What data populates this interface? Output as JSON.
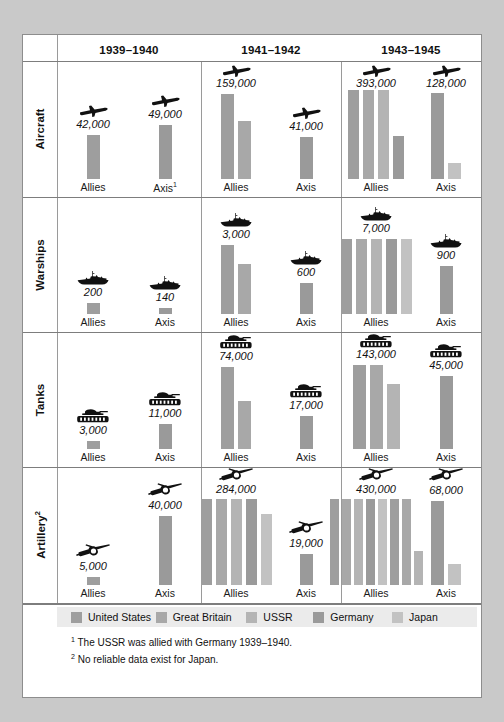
{
  "chart_data": {
    "type": "bar",
    "xlabel": "",
    "ylabel": "",
    "grid": false,
    "legend_position": "bottom",
    "columns": [
      "1939–1940",
      "1941–1942",
      "1943–1945"
    ],
    "rows": [
      "Aircraft",
      "Warships",
      "Tanks",
      "Artillery"
    ],
    "series": [
      {
        "name": "United States",
        "color": "#9e9e9e"
      },
      {
        "name": "Great Britain",
        "color": "#a8a8a8"
      },
      {
        "name": "USSR",
        "color": "#b4b4b4"
      },
      {
        "name": "Germany",
        "color": "#9a9a9a"
      },
      {
        "name": "Japan",
        "color": "#c2c2c2"
      }
    ],
    "cells": [
      {
        "row": "Aircraft",
        "column": "1939–1940",
        "side": "Allies",
        "label": "42,000",
        "icon": "aircraft-icon",
        "bars": [
          {
            "series": "United States",
            "height": 46
          }
        ]
      },
      {
        "row": "Aircraft",
        "column": "1939–1940",
        "side": "Axis",
        "side_note": "1",
        "label": "49,000",
        "icon": "aircraft-icon",
        "bars": [
          {
            "series": "Germany",
            "height": 56
          }
        ]
      },
      {
        "row": "Aircraft",
        "column": "1941–1942",
        "side": "Allies",
        "label": "159,000",
        "icon": "aircraft-icon",
        "bars": [
          {
            "series": "United States",
            "height": 89
          },
          {
            "series": "Great Britain",
            "height": 60
          }
        ]
      },
      {
        "row": "Aircraft",
        "column": "1941–1942",
        "side": "Axis",
        "label": "41,000",
        "icon": "aircraft-icon",
        "bars": [
          {
            "series": "Germany",
            "height": 44
          }
        ]
      },
      {
        "row": "Aircraft",
        "column": "1943–1945",
        "side": "Allies",
        "label": "393,000",
        "icon": "aircraft-icon",
        "bars": [
          {
            "series": "United States",
            "height": 93
          },
          {
            "series": "Great Britain",
            "height": 93
          },
          {
            "series": "USSR",
            "height": 93
          },
          {
            "series": "Germany",
            "height": 45
          }
        ]
      },
      {
        "row": "Aircraft",
        "column": "1943–1945",
        "side": "Axis",
        "label": "128,000",
        "icon": "aircraft-icon",
        "bars": [
          {
            "series": "Germany",
            "height": 90
          },
          {
            "series": "Japan",
            "height": 17
          }
        ]
      },
      {
        "row": "Warships",
        "column": "1939–1940",
        "side": "Allies",
        "label": "200",
        "icon": "warship-icon",
        "bars": [
          {
            "series": "United States",
            "height": 11
          }
        ]
      },
      {
        "row": "Warships",
        "column": "1939–1940",
        "side": "Axis",
        "label": "140",
        "icon": "warship-icon",
        "bars": [
          {
            "series": "Germany",
            "height": 6
          }
        ]
      },
      {
        "row": "Warships",
        "column": "1941–1942",
        "side": "Allies",
        "label": "3,000",
        "icon": "warship-icon",
        "bars": [
          {
            "series": "United States",
            "height": 72
          },
          {
            "series": "Great Britain",
            "height": 52
          }
        ]
      },
      {
        "row": "Warships",
        "column": "1941–1942",
        "side": "Axis",
        "label": "600",
        "icon": "warship-icon",
        "bars": [
          {
            "series": "Germany",
            "height": 32
          }
        ]
      },
      {
        "row": "Warships",
        "column": "1943–1945",
        "side": "Allies",
        "label": "7,000",
        "icon": "warship-icon",
        "bars": [
          {
            "series": "United States",
            "height": 78
          },
          {
            "series": "Great Britain",
            "height": 78
          },
          {
            "series": "USSR",
            "height": 78
          },
          {
            "series": "Germany",
            "height": 78
          },
          {
            "series": "Japan",
            "height": 78
          }
        ]
      },
      {
        "row": "Warships",
        "column": "1943–1945",
        "side": "Axis",
        "label": "900",
        "icon": "warship-icon",
        "bars": [
          {
            "series": "Germany",
            "height": 50
          }
        ]
      },
      {
        "row": "Tanks",
        "column": "1939–1940",
        "side": "Allies",
        "label": "3,000",
        "icon": "tank-icon",
        "bars": [
          {
            "series": "United States",
            "height": 8
          }
        ]
      },
      {
        "row": "Tanks",
        "column": "1939–1940",
        "side": "Axis",
        "label": "11,000",
        "icon": "tank-icon",
        "bars": [
          {
            "series": "Germany",
            "height": 26
          }
        ]
      },
      {
        "row": "Tanks",
        "column": "1941–1942",
        "side": "Allies",
        "label": "74,000",
        "icon": "tank-icon",
        "bars": [
          {
            "series": "United States",
            "height": 85
          },
          {
            "series": "Great Britain",
            "height": 50
          }
        ]
      },
      {
        "row": "Tanks",
        "column": "1941–1942",
        "side": "Axis",
        "label": "17,000",
        "icon": "tank-icon",
        "bars": [
          {
            "series": "Germany",
            "height": 34
          }
        ]
      },
      {
        "row": "Tanks",
        "column": "1943–1945",
        "side": "Allies",
        "label": "143,000",
        "icon": "tank-icon",
        "bars": [
          {
            "series": "United States",
            "height": 87
          },
          {
            "series": "Great Britain",
            "height": 87
          },
          {
            "series": "USSR",
            "height": 68
          }
        ]
      },
      {
        "row": "Tanks",
        "column": "1943–1945",
        "side": "Axis",
        "label": "45,000",
        "icon": "tank-icon",
        "bars": [
          {
            "series": "Germany",
            "height": 76
          }
        ]
      },
      {
        "row": "Artillery",
        "column": "1939–1940",
        "side": "Allies",
        "label": "5,000",
        "icon": "artillery-icon",
        "bars": [
          {
            "series": "United States",
            "height": 8
          }
        ]
      },
      {
        "row": "Artillery",
        "column": "1939–1940",
        "side": "Axis",
        "label": "40,000",
        "icon": "artillery-icon",
        "bars": [
          {
            "series": "Germany",
            "height": 72
          }
        ]
      },
      {
        "row": "Artillery",
        "column": "1941–1942",
        "side": "Allies",
        "label": "284,000",
        "icon": "artillery-icon",
        "bars": [
          {
            "series": "United States",
            "height": 90
          },
          {
            "series": "Great Britain",
            "height": 90
          },
          {
            "series": "USSR",
            "height": 90
          },
          {
            "series": "Germany",
            "height": 90
          },
          {
            "series": "Japan",
            "height": 74
          }
        ]
      },
      {
        "row": "Artillery",
        "column": "1941–1942",
        "side": "Axis",
        "label": "19,000",
        "icon": "artillery-icon",
        "bars": [
          {
            "series": "Germany",
            "height": 32
          }
        ]
      },
      {
        "row": "Artillery",
        "column": "1943–1945",
        "side": "Allies",
        "label": "430,000",
        "icon": "artillery-icon",
        "bars": [
          {
            "series": "United States",
            "height": 90
          },
          {
            "series": "Great Britain",
            "height": 90
          },
          {
            "series": "USSR",
            "height": 90
          },
          {
            "series": "Germany",
            "height": 90
          },
          {
            "series": "Japan",
            "height": 90
          },
          {
            "series": "United States",
            "height": 90
          },
          {
            "series": "Great Britain",
            "height": 90
          },
          {
            "series": "USSR",
            "height": 35
          }
        ]
      },
      {
        "row": "Artillery",
        "column": "1943–1945",
        "side": "Axis",
        "label": "68,000",
        "icon": "artillery-icon",
        "bars": [
          {
            "series": "Germany",
            "height": 88
          },
          {
            "series": "Japan",
            "height": 22
          }
        ]
      }
    ]
  },
  "header": {
    "columns": [
      {
        "label": "1939–1940"
      },
      {
        "label": "1941–1942"
      },
      {
        "label": "1943–1945"
      }
    ]
  },
  "rows": [
    {
      "label": "Aircraft",
      "note": ""
    },
    {
      "label": "Warships",
      "note": ""
    },
    {
      "label": "Tanks",
      "note": ""
    },
    {
      "label": "Artillery",
      "note": "2"
    }
  ],
  "sides": {
    "allies": "Allies",
    "axis": "Axis"
  },
  "legend": {
    "items": [
      {
        "label": "United States",
        "color": "#9e9e9e"
      },
      {
        "label": "Great Britain",
        "color": "#a8a8a8"
      },
      {
        "label": "USSR",
        "color": "#b4b4b4"
      },
      {
        "label": "Germany",
        "color": "#9a9a9a"
      },
      {
        "label": "Japan",
        "color": "#c2c2c2"
      }
    ]
  },
  "footnotes": [
    {
      "marker": "1",
      "text": "The USSR was allied with Germany 1939–1940."
    },
    {
      "marker": "2",
      "text": "No reliable data exist for Japan."
    }
  ]
}
